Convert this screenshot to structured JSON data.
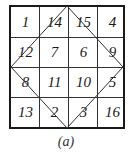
{
  "figure": {
    "caption": "(a)",
    "grid": [
      [
        "1",
        "14",
        "15",
        "4"
      ],
      [
        "12",
        "7",
        "6",
        "9"
      ],
      [
        "8",
        "11",
        "10",
        "5"
      ],
      [
        "13",
        "2",
        "3",
        "16"
      ]
    ],
    "diamond": "lines connecting midpoints of the four sides"
  }
}
